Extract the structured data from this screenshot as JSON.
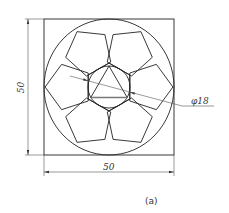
{
  "figure": {
    "caption": "(a)",
    "dimensions": {
      "height_label": "50",
      "width_label": "50",
      "diameter_label": "φ18"
    },
    "colors": {
      "line": "#222222",
      "thin_line": "#555555",
      "background": "#ffffff"
    },
    "shapes": {
      "outer_square": "50 x 50",
      "outer_circle": "inscribed in square",
      "hexagon": "central regular hexagon",
      "inner_circle_diameter": "18",
      "triangle": "equilateral, inscribed in inner circle",
      "pentagons": 6
    }
  }
}
